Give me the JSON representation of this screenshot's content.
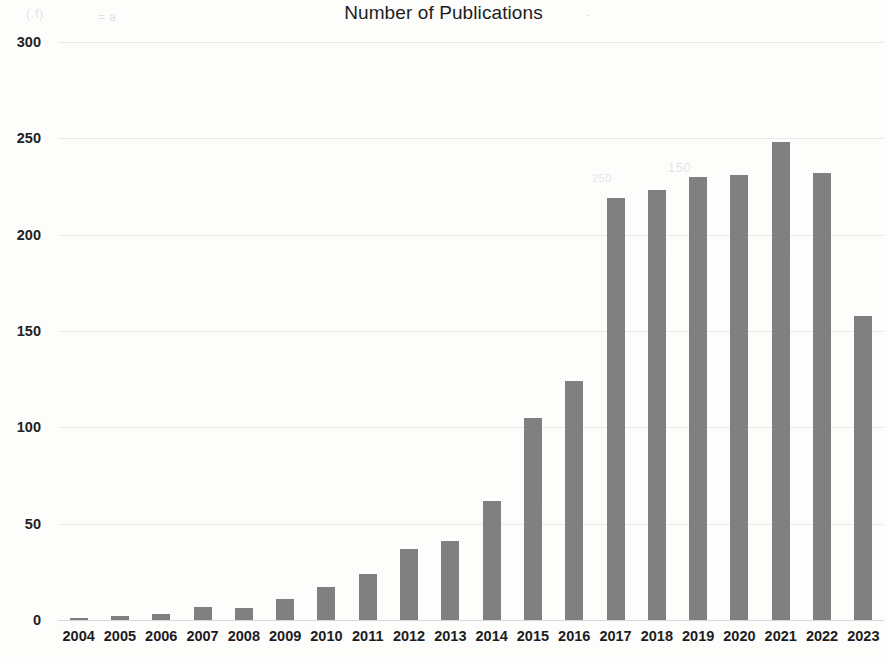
{
  "chart_data": {
    "type": "bar",
    "title": "Number of Publications",
    "xlabel": "",
    "ylabel": "",
    "categories": [
      "2004",
      "2005",
      "2006",
      "2007",
      "2008",
      "2009",
      "2010",
      "2011",
      "2012",
      "2013",
      "2014",
      "2015",
      "2016",
      "2017",
      "2018",
      "2019",
      "2020",
      "2021",
      "2022",
      "2023"
    ],
    "values": [
      1,
      2,
      3,
      7,
      6,
      11,
      17,
      24,
      37,
      41,
      62,
      105,
      124,
      219,
      223,
      230,
      231,
      248,
      232,
      158
    ],
    "series": [
      {
        "name": "Number of Publications",
        "values": [
          1,
          2,
          3,
          7,
          6,
          11,
          17,
          24,
          37,
          41,
          62,
          105,
          124,
          219,
          223,
          230,
          231,
          248,
          232,
          158
        ]
      }
    ],
    "ylim": [
      0,
      300
    ],
    "yticks": [
      0,
      50,
      100,
      150,
      200,
      250,
      300
    ],
    "ytick_labels": [
      "0",
      "50",
      "100",
      "150",
      "200",
      "250",
      "300"
    ],
    "grid": true,
    "legend": false,
    "bar_color": "#808080",
    "background_color": "#fdfdfc",
    "text_color": "#1e1e1e"
  },
  "artifacts": {
    "ghost_marks": [
      "(.f)",
      "= a",
      "-",
      "150",
      "250"
    ]
  }
}
